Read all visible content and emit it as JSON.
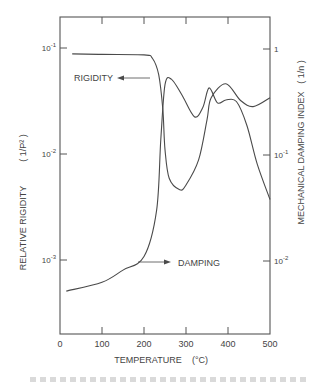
{
  "chart_data": {
    "type": "line",
    "title": "",
    "xlabel": "TEMPERATURE (°C)",
    "ylabel": "RELATIVE RIGIDITY (1/P²)",
    "y2label": "MECHANICAL DAMPING INDEX (1/n)",
    "xlim": [
      0,
      500
    ],
    "ylim": [
      0.0003,
      0.2
    ],
    "y2lim": [
      0.003,
      2
    ],
    "yscale": "log",
    "y2scale": "log",
    "grid": false,
    "legend": "none (inline labels with arrows)",
    "x_ticks": [
      "0",
      "100",
      "200",
      "300",
      "400",
      "500"
    ],
    "y_ticks": [
      "10^-1",
      "10^-2",
      "10^-3"
    ],
    "y2_ticks": [
      "1",
      "10^-1",
      "10^-2"
    ],
    "annotations": [
      {
        "text": "RIGIDITY",
        "arrow": "left",
        "points_to": "Rigidity curve"
      },
      {
        "text": "DAMPING",
        "arrow": "right",
        "points_to": "Damping curve"
      }
    ],
    "series": [
      {
        "name": "Rigidity",
        "axis": "left",
        "x": [
          29,
          100,
          200,
          220,
          235,
          245,
          250,
          260,
          285,
          300,
          330,
          350,
          360,
          395,
          430,
          460,
          500
        ],
        "values": [
          0.088,
          0.087,
          0.086,
          0.08,
          0.056,
          0.026,
          0.011,
          0.0059,
          0.0046,
          0.0051,
          0.0088,
          0.021,
          0.034,
          0.046,
          0.032,
          0.028,
          0.034
        ]
      },
      {
        "name": "Damping",
        "axis": "right",
        "x": [
          15,
          100,
          150,
          200,
          230,
          240,
          250,
          265,
          290,
          320,
          340,
          355,
          375,
          395,
          420,
          445,
          470,
          500
        ],
        "values": [
          0.0052,
          0.0063,
          0.0082,
          0.011,
          0.03,
          0.14,
          0.46,
          0.52,
          0.37,
          0.23,
          0.28,
          0.43,
          0.31,
          0.33,
          0.32,
          0.19,
          0.081,
          0.038
        ]
      }
    ]
  },
  "labels": {
    "x_title": "TEMPERATURE",
    "x_unit": "(°C)",
    "y_title": "RELATIVE  RIGIDITY",
    "y_unit": "( 1/P² )",
    "y2_title": "MECHANICAL  DAMPING  INDEX",
    "y2_unit": "( 1/n )",
    "rigidity": "RIGIDITY",
    "damping": "DAMPING"
  },
  "style": {
    "line_color": "#4a4a4a",
    "axis_color": "#555555",
    "text_color": "#444444"
  }
}
